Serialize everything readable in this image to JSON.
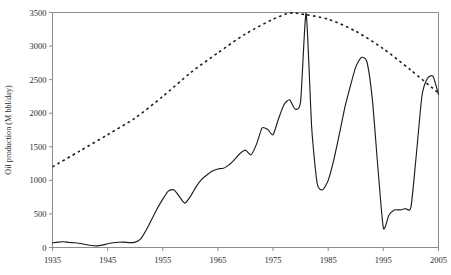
{
  "chart_data": {
    "type": "line",
    "title": "",
    "subtitle": "",
    "xlabel": "",
    "ylabel": "Oil production (M bbl/day)",
    "xlim": [
      1935,
      2005
    ],
    "ylim": [
      0,
      3500
    ],
    "grid": false,
    "legend": null,
    "legend_position": "none",
    "xticks": [
      1935,
      1945,
      1955,
      1965,
      1975,
      1985,
      1995,
      2005
    ],
    "xtick_labels": [
      "1935",
      "1945",
      "1955",
      "1965",
      "1975",
      "1985",
      "1995",
      "2005"
    ],
    "yticks": [
      0,
      500,
      1000,
      1500,
      2000,
      2500,
      3000,
      3500
    ],
    "ytick_labels": [
      "0",
      "500",
      "1000",
      "1500",
      "2000",
      "2500",
      "3000",
      "3500"
    ],
    "colors": {
      "axis": "#8c8c8c",
      "text": "#2b2b2b",
      "series_actual": "#1d1d1d",
      "series_model": "#1d1d1d",
      "background": "#ffffff"
    },
    "series": [
      {
        "name": "Actual oil production",
        "style": "solid",
        "x": [
          1935,
          1936,
          1937,
          1938,
          1939,
          1940,
          1941,
          1942,
          1943,
          1944,
          1945,
          1946,
          1947,
          1948,
          1949,
          1950,
          1951,
          1952,
          1953,
          1954,
          1955,
          1956,
          1957,
          1958,
          1959,
          1960,
          1961,
          1962,
          1963,
          1964,
          1965,
          1966,
          1967,
          1968,
          1969,
          1970,
          1971,
          1972,
          1973,
          1974,
          1975,
          1976,
          1977,
          1978,
          1979,
          1980,
          1981,
          1982,
          1983,
          1984,
          1985,
          1986,
          1987,
          1988,
          1989,
          1990,
          1991,
          1992,
          1993,
          1994,
          1995,
          1996,
          1997,
          1998,
          1999,
          2000,
          2001,
          2002,
          2003,
          2004,
          2005
        ],
        "y": [
          70,
          80,
          85,
          75,
          70,
          60,
          45,
          30,
          25,
          35,
          55,
          70,
          78,
          80,
          72,
          80,
          130,
          260,
          420,
          580,
          720,
          840,
          860,
          760,
          660,
          760,
          900,
          1010,
          1080,
          1140,
          1170,
          1180,
          1230,
          1310,
          1400,
          1450,
          1380,
          1540,
          1780,
          1760,
          1680,
          1920,
          2130,
          2200,
          2060,
          2180,
          3490,
          1790,
          950,
          860,
          1000,
          1300,
          1680,
          2080,
          2400,
          2690,
          2830,
          2770,
          2210,
          1200,
          290,
          480,
          560,
          560,
          580,
          600,
          1400,
          2260,
          2520,
          2550,
          2280
        ]
      },
      {
        "name": "Hubbert model curve",
        "style": "dotted",
        "x": [
          1935,
          1940,
          1945,
          1950,
          1955,
          1960,
          1965,
          1970,
          1975,
          1978,
          1980,
          1985,
          1990,
          1995,
          2000,
          2005
        ],
        "y": [
          1200,
          1440,
          1680,
          1930,
          2250,
          2600,
          2900,
          3180,
          3400,
          3490,
          3480,
          3400,
          3220,
          2960,
          2640,
          2300
        ]
      }
    ],
    "annotations": []
  }
}
